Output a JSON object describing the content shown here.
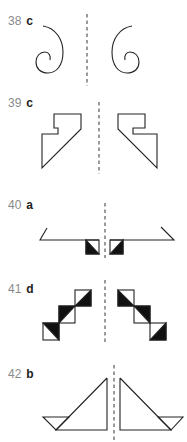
{
  "page": {
    "type": "answer-key"
  },
  "colors": {
    "ink": "#222222",
    "number": "#8a8a8a",
    "mirror_line": "#9a9a9a",
    "fill": "#111111"
  },
  "items": [
    {
      "number": "38",
      "answer": "c",
      "figure": "spiral-pair"
    },
    {
      "number": "39",
      "answer": "c",
      "figure": "hooked-polygon-pair"
    },
    {
      "number": "40",
      "answer": "a",
      "figure": "line-with-triangles"
    },
    {
      "number": "41",
      "answer": "d",
      "figure": "triangle-staircase-pair"
    },
    {
      "number": "42",
      "answer": "b",
      "figure": "sailboat-pair"
    }
  ]
}
